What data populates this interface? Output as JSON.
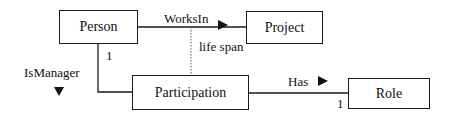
{
  "diagram": {
    "entities": [
      {
        "id": "person",
        "label": "Person"
      },
      {
        "id": "project",
        "label": "Project"
      },
      {
        "id": "participation",
        "label": "Participation"
      },
      {
        "id": "role",
        "label": "Role"
      }
    ],
    "relationships": [
      {
        "id": "works_in",
        "label": "WorksIn",
        "direction": "right",
        "from": "person",
        "to": "project"
      },
      {
        "id": "is_manager",
        "label": "IsManager",
        "direction": "down",
        "from": "person",
        "to": "participation",
        "multiplicity": "1"
      },
      {
        "id": "has",
        "label": "Has",
        "direction": "right",
        "from": "participation",
        "to": "role",
        "multiplicity": "1"
      }
    ],
    "annotations": [
      {
        "id": "life_span",
        "label": "life span",
        "style": "dotted",
        "links": [
          "works_in",
          "participation"
        ]
      }
    ]
  }
}
